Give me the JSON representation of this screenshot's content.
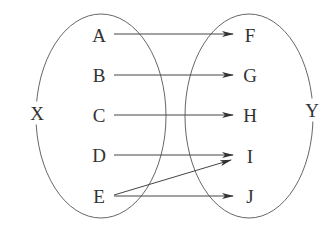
{
  "diagram": {
    "type": "set-mapping",
    "sets": [
      {
        "name": "X",
        "elements": [
          "A",
          "B",
          "C",
          "D",
          "E"
        ]
      },
      {
        "name": "Y",
        "elements": [
          "F",
          "G",
          "H",
          "I",
          "J"
        ]
      }
    ],
    "set_labels": {
      "left": "X",
      "right": "Y"
    },
    "left_elements": [
      "A",
      "B",
      "C",
      "D",
      "E"
    ],
    "right_elements": [
      "F",
      "G",
      "H",
      "I",
      "J"
    ],
    "mappings": [
      {
        "from": "A",
        "to": "F"
      },
      {
        "from": "B",
        "to": "G"
      },
      {
        "from": "C",
        "to": "H"
      },
      {
        "from": "D",
        "to": "I"
      },
      {
        "from": "E",
        "to": "I"
      },
      {
        "from": "E",
        "to": "J"
      }
    ],
    "colors": {
      "stroke": "#555555",
      "text": "#333333",
      "background": "#ffffff"
    }
  }
}
